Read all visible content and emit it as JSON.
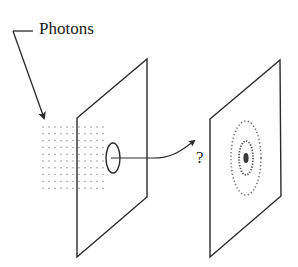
{
  "diagram": {
    "labels": {
      "photons": "Photons",
      "question": "?"
    },
    "colors": {
      "stroke": "#2a2a2a",
      "dots": "#8a8a8a",
      "background": "#ffffff"
    },
    "elements": {
      "photon_beam": {
        "type": "dot-grid",
        "cols": 11,
        "rows": 10
      },
      "first_screen": {
        "type": "parallelogram-screen",
        "aperture": "elliptical-hole"
      },
      "second_screen": {
        "type": "parallelogram-screen",
        "pattern": "diffraction-rings",
        "ring_count": 2,
        "central_spot": true
      },
      "transition_arrow": {
        "type": "curved-arrow",
        "annotation": "?"
      }
    }
  }
}
